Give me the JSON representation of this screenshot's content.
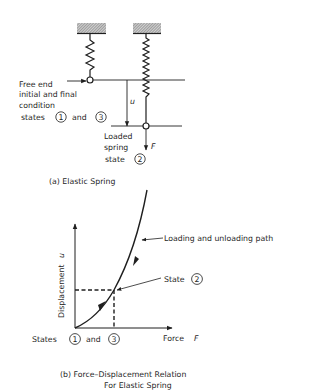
{
  "figure_a": {
    "caption": "(a) Elastic Spring",
    "free_end_label_lines": [
      "Free end",
      "initial and final",
      "condition"
    ],
    "states_label": {
      "prefix": "states",
      "state1": "1",
      "and": "and",
      "state3": "3"
    },
    "displacement_symbol": "u",
    "force_symbol": "F",
    "loaded_label_lines": [
      "Loaded",
      "spring"
    ],
    "loaded_state_label": {
      "prefix": "state",
      "state": "2"
    }
  },
  "figure_b": {
    "caption_line1": "(b) Force–Displacement Relation",
    "caption_line2": "For Elastic Spring",
    "y_axis_label": "Displacement",
    "y_axis_symbol": "u",
    "x_axis_label": "Force",
    "x_axis_symbol": "F",
    "path_label": "Loading and unloading path",
    "state2_label": {
      "prefix": "State",
      "state": "2"
    },
    "origin_label": {
      "prefix": "States",
      "state1": "1",
      "and": "and",
      "state3": "3"
    }
  },
  "colors": {
    "ink": "#1f1f1f",
    "hatch": "#8a8a8a",
    "background": "#ffffff"
  }
}
